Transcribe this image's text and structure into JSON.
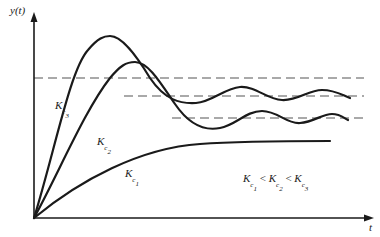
{
  "diagram": {
    "y_axis_label": "y(t)",
    "x_axis_label": "t",
    "curves": [
      {
        "name": "Kc3",
        "label_base": "K",
        "label_sub": "c",
        "label_subsub": "3"
      },
      {
        "name": "Kc2",
        "label_base": "K",
        "label_sub": "c",
        "label_subsub": "2"
      },
      {
        "name": "Kc1",
        "label_base": "K",
        "label_sub": "c",
        "label_subsub": "1"
      }
    ],
    "relation": {
      "parts": [
        "K",
        "c",
        "1",
        " < ",
        "K",
        "c",
        "2",
        " < ",
        "K",
        "c",
        "3"
      ]
    },
    "colors": {
      "curve": "#1a1a1a",
      "dashed": "#555555",
      "axis": "#1a1a1a"
    }
  }
}
